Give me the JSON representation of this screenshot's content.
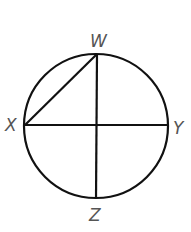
{
  "diagram": {
    "type": "circle-geometry",
    "circle": {
      "cx": 96,
      "cy": 126,
      "r": 72
    },
    "points": {
      "W": {
        "label": "W",
        "x": 97,
        "y": 54
      },
      "X": {
        "label": "X",
        "x": 25,
        "y": 125
      },
      "Y": {
        "label": "Y",
        "x": 167,
        "y": 125
      },
      "Z": {
        "label": "Z",
        "x": 96,
        "y": 199
      }
    },
    "segments": [
      {
        "from": "X",
        "to": "Y",
        "name": "diameter-xy"
      },
      {
        "from": "W",
        "to": "Z",
        "name": "diameter-wz"
      },
      {
        "from": "X",
        "to": "W",
        "name": "chord-xw"
      }
    ],
    "labels": {
      "W": "W",
      "X": "X",
      "Y": "Y",
      "Z": "Z"
    },
    "colors": {
      "line": "#111111",
      "label": "#555555",
      "background": "#ffffff"
    }
  }
}
